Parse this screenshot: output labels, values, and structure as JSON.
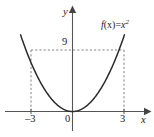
{
  "figure": {
    "width": 154,
    "height": 137,
    "background": "#ffffff",
    "curve_color": "#2b2b2b",
    "axis_color": "#555555",
    "guide_color": "#777777"
  },
  "labels": {
    "y_axis": "y",
    "x_axis": "x",
    "origin": "0",
    "x_tick_neg3": "–3",
    "x_tick_pos3": "3",
    "y_tick_9": "9",
    "function_name": "f",
    "function_arg": "(x)=",
    "function_base": "x",
    "function_exponent": "2"
  },
  "chart_data": {
    "type": "line",
    "title": "",
    "subtitle": "",
    "xlabel": "x",
    "ylabel": "y",
    "xlim": [
      -4.2,
      4.6
    ],
    "ylim": [
      -1.1,
      12.5
    ],
    "grid": false,
    "legend_position": "inside-top-right",
    "annotations": [
      {
        "text": "f(x)=x²",
        "x": 3.2,
        "y": 11.2,
        "style": "italic-serif"
      },
      {
        "text": "9",
        "x": -0.45,
        "y": 9.6,
        "style": "serif"
      },
      {
        "text": "0",
        "x": -0.35,
        "y": -0.85,
        "style": "serif"
      },
      {
        "text": "–3",
        "x": -3.0,
        "y": -0.85,
        "style": "serif"
      },
      {
        "text": "3",
        "x": 3.0,
        "y": -0.85,
        "style": "serif"
      },
      {
        "text": "y",
        "x": -0.55,
        "y": 12.1,
        "style": "italic-serif"
      },
      {
        "text": "x",
        "x": 4.35,
        "y": -0.6,
        "style": "italic-serif"
      }
    ],
    "guide_lines": [
      {
        "type": "horizontal",
        "y": 9,
        "x_from": -3,
        "x_to": 3,
        "dashed": true
      },
      {
        "type": "vertical",
        "x": -3,
        "y_from": 0,
        "y_to": 9,
        "dashed": true
      },
      {
        "type": "vertical",
        "x": 3,
        "y_from": 0,
        "y_to": 9,
        "dashed": true
      }
    ],
    "x_ticks": [
      -3,
      0,
      3
    ],
    "x_tick_labels": [
      "–3",
      "0",
      "3"
    ],
    "y_ticks": [
      9
    ],
    "y_tick_labels": [
      "9"
    ],
    "series": [
      {
        "name": "f(x)=x²",
        "equation": "y = x^2",
        "x": [
          -3.35,
          -3.0,
          -2.5,
          -2.0,
          -1.5,
          -1.0,
          -0.5,
          0.0,
          0.5,
          1.0,
          1.5,
          2.0,
          2.5,
          3.0,
          3.35
        ],
        "values": [
          11.22,
          9.0,
          6.25,
          4.0,
          2.25,
          1.0,
          0.25,
          0.0,
          0.25,
          1.0,
          2.25,
          4.0,
          6.25,
          9.0,
          11.22
        ]
      }
    ],
    "key_points": [
      {
        "label": "vertex",
        "x": 0,
        "y": 0
      },
      {
        "label": "left",
        "x": -3,
        "y": 9
      },
      {
        "label": "right",
        "x": 3,
        "y": 9
      }
    ]
  }
}
